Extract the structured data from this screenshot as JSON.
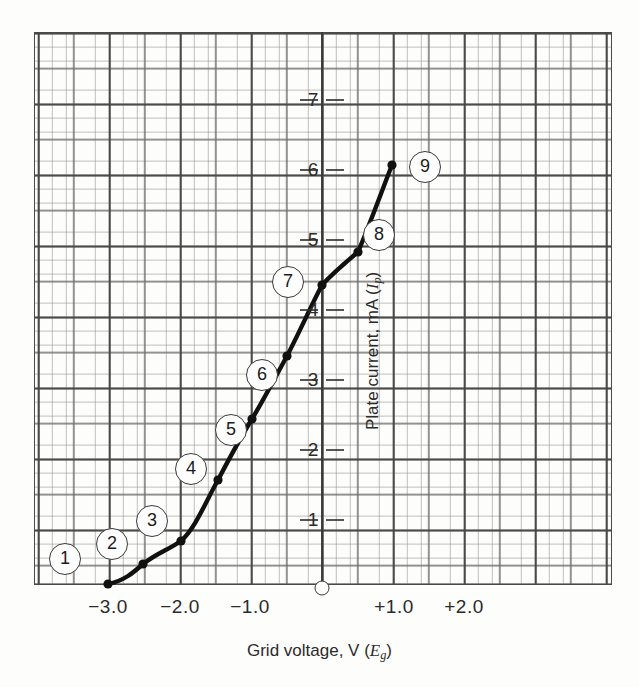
{
  "chart_data": {
    "type": "line",
    "title": "",
    "xlabel": "Grid voltage, V (Eg)",
    "ylabel": "Plate current, mA (Ip)",
    "xlim": [
      -3.5,
      3.0
    ],
    "ylim": [
      0,
      7.8
    ],
    "grid": true,
    "grid_style": "graph-paper",
    "legend": "none",
    "x": [
      -3.0,
      -2.5,
      -2.0,
      -1.5,
      -1.0,
      -0.5,
      0.0,
      0.5,
      1.0
    ],
    "values": [
      0.0,
      0.3,
      0.65,
      1.6,
      2.55,
      3.55,
      4.65,
      5.15,
      6.1
    ],
    "point_labels": [
      "1",
      "2",
      "3",
      "4",
      "5",
      "6",
      "7",
      "8",
      "9"
    ],
    "xticks": [
      -3.0,
      -2.0,
      -1.0,
      1.0,
      2.0
    ],
    "xticklabels": [
      "−3.0",
      "−2.0",
      "−1.0",
      "+1.0",
      "+2.0"
    ],
    "yticks": [
      1,
      2,
      3,
      4,
      5,
      6,
      7
    ],
    "yticklabels": [
      "1",
      "2",
      "3",
      "4",
      "5",
      "6",
      "7"
    ],
    "origin_marker": "open-circle-at-zero"
  },
  "axes": {
    "x_title_prefix": "Grid voltage, V (",
    "x_title_symbol": "E",
    "x_title_subscript": "g",
    "x_title_suffix": ")",
    "y_title_prefix": "Plate current, mA (",
    "y_title_symbol": "I",
    "y_title_subscript": "p",
    "y_title_suffix": ")"
  },
  "callouts": [
    {
      "label": "1",
      "x": 65,
      "y": 559
    },
    {
      "label": "2",
      "x": 112,
      "y": 544
    },
    {
      "label": "3",
      "x": 152,
      "y": 521
    },
    {
      "label": "4",
      "x": 191,
      "y": 469
    },
    {
      "label": "5",
      "x": 231,
      "y": 430
    },
    {
      "label": "6",
      "x": 262,
      "y": 375
    },
    {
      "label": "7",
      "x": 288,
      "y": 282
    },
    {
      "label": "8",
      "x": 379,
      "y": 235
    },
    {
      "label": "9",
      "x": 425,
      "y": 167
    }
  ],
  "points_px": [
    {
      "label": "1",
      "x": 108,
      "y": 584
    },
    {
      "label": "2",
      "x": 143,
      "y": 564
    },
    {
      "label": "3",
      "x": 181,
      "y": 541
    },
    {
      "label": "4",
      "x": 218,
      "y": 480
    },
    {
      "label": "5",
      "x": 252,
      "y": 419
    },
    {
      "label": "6",
      "x": 287,
      "y": 356
    },
    {
      "label": "7",
      "x": 322,
      "y": 285
    },
    {
      "label": "8",
      "x": 358,
      "y": 252
    },
    {
      "label": "9",
      "x": 392,
      "y": 165
    }
  ],
  "curve_path": "M 108 584 C 124 581, 134 572, 143 564 C 157 553, 168 550, 181 541 C 196 527, 205 503, 218 480 C 229 459, 241 437, 252 419 C 264 399, 276 376, 287 356 C 299 333, 311 306, 322 285 C 334 272, 346 262, 358 252 C 370 224, 381 193, 392 165",
  "xtick_px": [
    {
      "label": "−3.0",
      "x": 108
    },
    {
      "label": "−2.0",
      "x": 180
    },
    {
      "label": "−1.0",
      "x": 250
    },
    {
      "label": "+1.0",
      "x": 394
    },
    {
      "label": "+2.0",
      "x": 464
    }
  ],
  "ytick_px": [
    {
      "label": "1",
      "y": 520
    },
    {
      "label": "2",
      "y": 450
    },
    {
      "label": "3",
      "y": 380
    },
    {
      "label": "4",
      "y": 310
    },
    {
      "label": "5",
      "y": 240
    },
    {
      "label": "6",
      "y": 170
    },
    {
      "label": "7",
      "y": 100
    }
  ],
  "origin_px": {
    "x": 322,
    "y": 588
  }
}
